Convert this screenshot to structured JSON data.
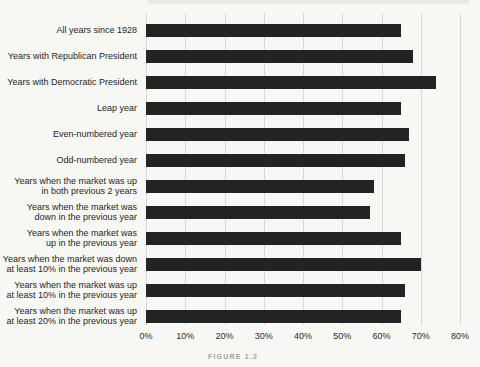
{
  "page": {
    "background": "#f7f7f4"
  },
  "figure": {
    "caption": "FIGURE 1.2"
  },
  "chart_data": {
    "type": "bar",
    "orientation": "horizontal",
    "title": "",
    "xlabel": "",
    "ylabel": "",
    "xlim": [
      0,
      80
    ],
    "x_ticks": [
      "0%",
      "10%",
      "20%",
      "30%",
      "40%",
      "50%",
      "60%",
      "70%",
      "80%"
    ],
    "grid": "vertical",
    "legend": "none",
    "bar_color": "#232323",
    "categories": [
      "All years since 1928",
      "Years with Republican President",
      "Years with Democratic President",
      "Leap year",
      "Even-numbered year",
      "Odd-numbered year",
      "Years when the market was up\nin both previous 2 years",
      "Years when the market was\ndown in the previous year",
      "Years when the market was\nup in the previous year",
      "Years when the market was down\nat least 10% in the previous year",
      "Years when the market was up\nat least 10% in the previous year",
      "Years when the market was up\nat least 20% in the previous year"
    ],
    "values": [
      65,
      68,
      74,
      65,
      67,
      66,
      58,
      57,
      65,
      70,
      66,
      65
    ]
  }
}
